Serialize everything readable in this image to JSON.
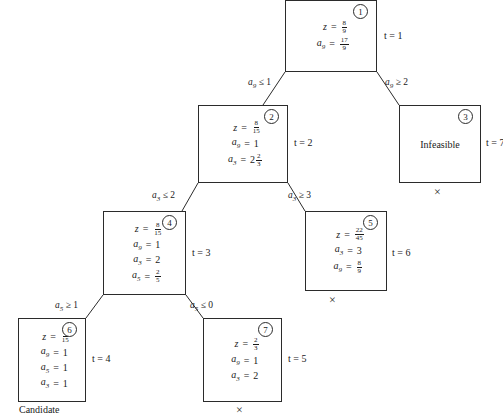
{
  "diagram": {
    "nodes": [
      {
        "id": "1",
        "badge": "1",
        "t_label": "t = 1",
        "rows": [
          {
            "lhs": "z",
            "sub": "",
            "eq": "=",
            "type": "frac",
            "num": "8",
            "den": "9"
          },
          {
            "lhs": "a",
            "sub": "9",
            "eq": "=",
            "type": "frac",
            "num": "17",
            "den": "9"
          }
        ]
      },
      {
        "id": "2",
        "badge": "2",
        "t_label": "t = 2",
        "rows": [
          {
            "lhs": "z",
            "sub": "",
            "eq": "=",
            "type": "frac",
            "num": "8",
            "den": "15"
          },
          {
            "lhs": "a",
            "sub": "9",
            "eq": "=",
            "type": "int",
            "value": "1"
          },
          {
            "lhs": "a",
            "sub": "3",
            "eq": "=",
            "type": "mixed",
            "whole": "2",
            "num": "2",
            "den": "3"
          }
        ]
      },
      {
        "id": "3",
        "badge": "3",
        "t_label": "t = 7",
        "text": "Infeasible",
        "mark": "×",
        "rows": []
      },
      {
        "id": "4",
        "badge": "4",
        "t_label": "t = 3",
        "rows": [
          {
            "lhs": "z",
            "sub": "",
            "eq": "=",
            "type": "frac",
            "num": "8",
            "den": "15"
          },
          {
            "lhs": "a",
            "sub": "9",
            "eq": "=",
            "type": "int",
            "value": "1"
          },
          {
            "lhs": "a",
            "sub": "3",
            "eq": "=",
            "type": "int",
            "value": "2"
          },
          {
            "lhs": "a",
            "sub": "5",
            "eq": "=",
            "type": "frac",
            "num": "2",
            "den": "5"
          }
        ]
      },
      {
        "id": "5",
        "badge": "5",
        "t_label": "t = 6",
        "mark": "×",
        "rows": [
          {
            "lhs": "z",
            "sub": "",
            "eq": "=",
            "type": "frac",
            "num": "22",
            "den": "45"
          },
          {
            "lhs": "a",
            "sub": "3",
            "eq": "=",
            "type": "int",
            "value": "3"
          },
          {
            "lhs": "a",
            "sub": "9",
            "eq": "=",
            "type": "frac",
            "num": "8",
            "den": "9"
          }
        ]
      },
      {
        "id": "6",
        "badge": "6",
        "t_label": "t = 4",
        "caption": "Candidate",
        "rows": [
          {
            "lhs": "z",
            "sub": "",
            "eq": "=",
            "type": "frac",
            "num": "8",
            "den": "15"
          },
          {
            "lhs": "a",
            "sub": "9",
            "eq": "=",
            "type": "int",
            "value": "1"
          },
          {
            "lhs": "a",
            "sub": "5",
            "eq": "=",
            "type": "int",
            "value": "1"
          },
          {
            "lhs": "a",
            "sub": "3",
            "eq": "=",
            "type": "int",
            "value": "1"
          }
        ]
      },
      {
        "id": "7",
        "badge": "7",
        "t_label": "t = 5",
        "mark": "×",
        "rows": [
          {
            "lhs": "z",
            "sub": "",
            "eq": "=",
            "type": "frac",
            "num": "2",
            "den": "3"
          },
          {
            "lhs": "a",
            "sub": "9",
            "eq": "=",
            "type": "int",
            "value": "1"
          },
          {
            "lhs": "a",
            "sub": "3",
            "eq": "=",
            "type": "int",
            "value": "2"
          }
        ]
      }
    ],
    "branch_labels": [
      {
        "id": "b1-left",
        "var": "a",
        "sub": "9",
        "rel": "≤",
        "value": "1"
      },
      {
        "id": "b1-right",
        "var": "a",
        "sub": "9",
        "rel": "≥",
        "value": "2"
      },
      {
        "id": "b2-left",
        "var": "a",
        "sub": "3",
        "rel": "≤",
        "value": "2"
      },
      {
        "id": "b2-right",
        "var": "a",
        "sub": "3",
        "rel": "≥",
        "value": "3"
      },
      {
        "id": "b4-left",
        "var": "a",
        "sub": "5",
        "rel": "≥",
        "value": "1"
      },
      {
        "id": "b4-right",
        "var": "a",
        "sub": "5",
        "rel": "≤",
        "value": "0"
      }
    ],
    "colors": {
      "line": "#2b2b2b",
      "text": "#1a1a1a",
      "background": "#ffffff"
    }
  }
}
